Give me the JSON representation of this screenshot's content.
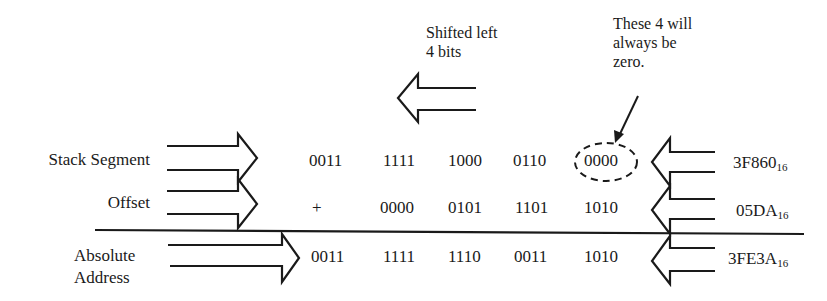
{
  "annotations": {
    "shift_note": [
      "Shifted left",
      "4 bits"
    ],
    "zero_note": [
      "These 4 will",
      "always be",
      "zero."
    ]
  },
  "rows": [
    {
      "label": [
        "Stack Segment"
      ],
      "operator": "",
      "nibbles": [
        "0011",
        "1111",
        "1000",
        "0110",
        "0000"
      ],
      "hex": "3F860",
      "base": "16"
    },
    {
      "label": [
        "Offset"
      ],
      "operator": "+",
      "nibbles": [
        "0000",
        "0101",
        "1101",
        "1010"
      ],
      "hex": "05DA",
      "base": "16"
    },
    {
      "label": [
        "Absolute",
        "Address"
      ],
      "operator": "",
      "nibbles": [
        "0011",
        "1111",
        "1110",
        "0011",
        "1010"
      ],
      "hex": "3FE3A",
      "base": "16"
    }
  ],
  "colors": {
    "ink": "#1a1a1a",
    "background": "#ffffff"
  }
}
